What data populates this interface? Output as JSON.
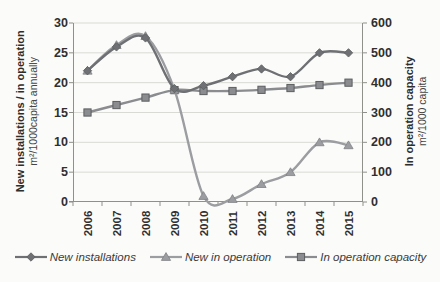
{
  "chart_data": {
    "type": "line",
    "title": "",
    "categories": [
      "2006",
      "2007",
      "2008",
      "2009",
      "2010",
      "2011",
      "2012",
      "2013",
      "2014",
      "2015"
    ],
    "series": [
      {
        "name": "New installations",
        "axis": "left",
        "marker": "diamond",
        "color": "#6e7073",
        "values": [
          22,
          26,
          27.5,
          19,
          19.5,
          21,
          22.3,
          21,
          25,
          25
        ]
      },
      {
        "name": "New in operation",
        "axis": "left",
        "marker": "triangle",
        "color": "#9b9da0",
        "values": [
          22,
          26.3,
          27.8,
          18.8,
          1,
          0.5,
          3,
          5,
          10,
          9.5
        ]
      },
      {
        "name": "In operation capacity",
        "axis": "right",
        "marker": "square",
        "color": "#8a8c8f",
        "values": [
          300,
          325,
          350,
          375,
          372,
          372,
          376,
          382,
          392,
          400
        ]
      }
    ],
    "left_axis": {
      "title_bold": "New installations / in operation",
      "title_sub": "m²/1000capita annually",
      "min": 0,
      "max": 30,
      "ticks": [
        0,
        5,
        10,
        15,
        20,
        25,
        30
      ]
    },
    "right_axis": {
      "title_bold": "In operation capacity",
      "title_sub": "m²/1000 capita",
      "min": 0,
      "max": 600,
      "ticks": [
        0,
        100,
        200,
        300,
        400,
        500,
        600
      ]
    },
    "grid": true,
    "legend_position": "bottom"
  },
  "colors": {
    "background": "#fbfbf9",
    "gridline": "#d9d9d5",
    "axis": "#8f8f8b",
    "tick_text": "#2f2f2f",
    "legend_text": "#3a3a3a"
  }
}
